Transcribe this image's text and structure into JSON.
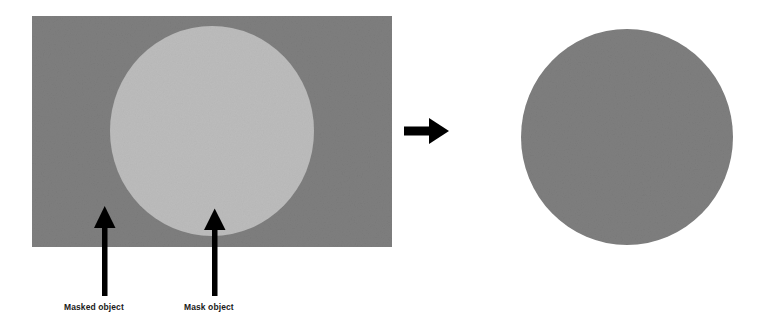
{
  "diagram": {
    "background_color": "#ffffff",
    "annotations": [
      {
        "id": "masked-object",
        "label": "Masked object",
        "target": "base-rectangle",
        "x": 64,
        "y": 302
      },
      {
        "id": "mask-object",
        "label": "Mask object",
        "target": "mask-ellipse",
        "x": 184,
        "y": 302
      }
    ],
    "shapes": {
      "base_rectangle": {
        "name": "Masked object",
        "type": "rectangle",
        "fill": "#7e7e7e",
        "x": 32,
        "y": 16,
        "width": 360,
        "height": 231
      },
      "mask_ellipse": {
        "name": "Mask object",
        "type": "ellipse",
        "fill": "#bcbcbc",
        "cx": 212,
        "cy": 131,
        "rx": 102,
        "ry": 105
      },
      "result_ellipse": {
        "name": "Result of masking",
        "type": "ellipse",
        "fill": "#7e7e7e",
        "cx": 627,
        "cy": 137,
        "rx": 106,
        "ry": 108
      }
    },
    "arrows": {
      "flow_arrow": {
        "name": "transform-arrow",
        "direction": "right",
        "color": "#000000",
        "x1": 404,
        "x2": 447,
        "y": 131
      },
      "callout_masked": {
        "name": "masked-object-pointer",
        "direction": "up",
        "color": "#000000",
        "x": 105,
        "tip_y": 207,
        "tail_y": 295
      },
      "callout_mask": {
        "name": "mask-object-pointer",
        "direction": "up",
        "color": "#000000",
        "x": 215,
        "tip_y": 209,
        "tail_y": 295
      }
    },
    "colors": {
      "dark_gray": "#7e7e7e",
      "light_gray": "#bcbcbc",
      "stroke_black": "#000000",
      "page_white": "#ffffff"
    }
  }
}
